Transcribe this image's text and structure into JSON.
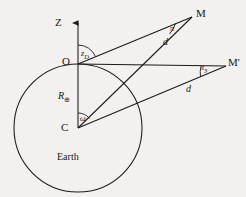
{
  "figure": {
    "background_color": "#f2f1ef",
    "ink_color": "#1a1a1a",
    "points": {
      "zenith_axis": "Z",
      "observer": "O",
      "earth_center": "C",
      "object_true": "M",
      "object_apparent": "M'"
    },
    "segments": {
      "earth_radius": "R",
      "earth_radius_subscript": "⊕",
      "distance_to_M": "d",
      "distance_to_Mprime": "d"
    },
    "angles": {
      "zenith_distance": "z",
      "zenith_distance_subscript": "D",
      "parallax_at_M": "π",
      "parallax_at_M_subscript": "3",
      "parallax_at_Mprime": "π",
      "parallax_at_Mprime_subscript": "3",
      "geocentric_angle": "ω"
    },
    "regions": {
      "planet": "Earth"
    }
  }
}
